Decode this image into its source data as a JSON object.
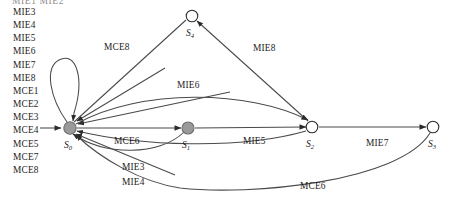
{
  "clipped_header": {
    "text": "MIE1  MIE2"
  },
  "legend": {
    "items": [
      {
        "label": "MIE3"
      },
      {
        "label": "MIE4"
      },
      {
        "label": "MIE5"
      },
      {
        "label": "MIE6"
      },
      {
        "label": "MIE7"
      },
      {
        "label": "MIE8"
      },
      {
        "label": "MCE1"
      },
      {
        "label": "MCE2"
      },
      {
        "label": "MCE3"
      },
      {
        "label": "MCE4"
      },
      {
        "label": "MCE5"
      },
      {
        "label": "MCE7"
      },
      {
        "label": "MCE8"
      }
    ]
  },
  "diagram": {
    "type": "state-transition-graph",
    "colors": {
      "edge": "#4a4a4a",
      "node_filled": "#9a9a9a",
      "node_open": "#ffffff",
      "node_stroke": "#2b2b2b",
      "text": "#1c1c1c"
    },
    "nodes": [
      {
        "id": "S0",
        "name": "S",
        "sub": "0",
        "x": 70,
        "y": 128,
        "r": 6.2,
        "style": "filled",
        "label_x": 64,
        "label_y": 148
      },
      {
        "id": "S1",
        "name": "S",
        "sub": "1",
        "x": 188,
        "y": 128,
        "r": 6.0,
        "style": "filled",
        "label_x": 182,
        "label_y": 148
      },
      {
        "id": "S2",
        "name": "S",
        "sub": "2",
        "x": 312,
        "y": 127,
        "r": 5.8,
        "style": "open",
        "label_x": 306,
        "label_y": 147
      },
      {
        "id": "S3",
        "name": "S",
        "sub": "3",
        "x": 433,
        "y": 127,
        "r": 5.8,
        "style": "open",
        "label_x": 428,
        "label_y": 147
      },
      {
        "id": "S4",
        "name": "S",
        "sub": "4",
        "x": 192,
        "y": 16,
        "r": 5.8,
        "style": "open",
        "label_x": 186,
        "label_y": 36
      }
    ],
    "edge_labels": [
      {
        "id": "MCE8",
        "text": "MCE8",
        "x": 104,
        "y": 50
      },
      {
        "id": "MIE8",
        "text": "MIE8",
        "x": 253,
        "y": 51
      },
      {
        "id": "MIE6",
        "text": "MIE6",
        "x": 177,
        "y": 88
      },
      {
        "id": "MCE6_top",
        "text": "MCE6",
        "x": 114,
        "y": 144
      },
      {
        "id": "MIE5",
        "text": "MIE5",
        "x": 243,
        "y": 144
      },
      {
        "id": "MIE7",
        "text": "MIE7",
        "x": 366,
        "y": 146
      },
      {
        "id": "MIE3",
        "text": "MIE3",
        "x": 122,
        "y": 170
      },
      {
        "id": "MIE4",
        "text": "MIE4",
        "x": 122,
        "y": 185
      },
      {
        "id": "MCE6_bottom",
        "text": "MCE6",
        "x": 300,
        "y": 189
      }
    ]
  }
}
